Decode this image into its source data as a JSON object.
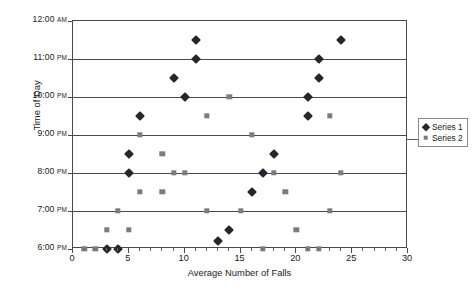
{
  "chart_data": {
    "type": "scatter",
    "title": "",
    "xlabel": "Average Number of Falls",
    "ylabel": "Time of Day",
    "xlim": [
      0,
      30
    ],
    "xticks": [
      0,
      5,
      10,
      15,
      20,
      25,
      30
    ],
    "xtick_labels": [
      "0",
      "5",
      "10",
      "15",
      "20",
      "25",
      "30"
    ],
    "yticks": [
      "6:00 PM",
      "7:00 PM",
      "8:00 PM",
      "9:00 PM",
      "10:00 PM",
      "11:00 PM",
      "12:00 AM"
    ],
    "ytick_labels": [
      {
        "time": "12:00",
        "meridiem": "AM",
        "hour_value": 24
      },
      {
        "time": "11:00",
        "meridiem": "PM",
        "hour_value": 23
      },
      {
        "time": "10:00",
        "meridiem": "PM",
        "hour_value": 22
      },
      {
        "time": "9:00",
        "meridiem": "PM",
        "hour_value": 21
      },
      {
        "time": "8:00",
        "meridiem": "PM",
        "hour_value": 20
      },
      {
        "time": "7:00",
        "meridiem": "PM",
        "hour_value": 19
      },
      {
        "time": "6:00",
        "meridiem": "PM",
        "hour_value": 18
      }
    ],
    "ylim": [
      18,
      24
    ],
    "grid": "horizontal",
    "legend_position": "right",
    "legend": [
      "Series 1",
      "Series 2"
    ],
    "series": [
      {
        "name": "Series 1",
        "marker": "diamond",
        "color": "#26262e",
        "points": [
          {
            "x": 3,
            "y": 18.0,
            "time": "6:00 PM"
          },
          {
            "x": 4,
            "y": 18.0,
            "time": "6:00 PM"
          },
          {
            "x": 13,
            "y": 18.2,
            "time": "6:12 PM"
          },
          {
            "x": 14,
            "y": 18.5,
            "time": "6:30 PM"
          },
          {
            "x": 16,
            "y": 19.5,
            "time": "7:30 PM"
          },
          {
            "x": 5,
            "y": 20.0,
            "time": "8:00 PM"
          },
          {
            "x": 17,
            "y": 20.0,
            "time": "8:00 PM"
          },
          {
            "x": 5,
            "y": 20.5,
            "time": "8:30 PM"
          },
          {
            "x": 18,
            "y": 20.5,
            "time": "8:30 PM"
          },
          {
            "x": 6,
            "y": 21.5,
            "time": "9:30 PM"
          },
          {
            "x": 21,
            "y": 21.5,
            "time": "9:30 PM"
          },
          {
            "x": 10,
            "y": 22.0,
            "time": "10:00 PM"
          },
          {
            "x": 21,
            "y": 22.0,
            "time": "10:00 PM"
          },
          {
            "x": 9,
            "y": 22.5,
            "time": "10:30 PM"
          },
          {
            "x": 22,
            "y": 22.5,
            "time": "10:30 PM"
          },
          {
            "x": 11,
            "y": 23.0,
            "time": "11:00 PM"
          },
          {
            "x": 22,
            "y": 23.0,
            "time": "11:00 PM"
          },
          {
            "x": 11,
            "y": 23.5,
            "time": "11:30 PM"
          },
          {
            "x": 24,
            "y": 23.5,
            "time": "11:30 PM"
          }
        ]
      },
      {
        "name": "Series 2",
        "marker": "square",
        "color": "#7b7b83",
        "points": [
          {
            "x": 1,
            "y": 18.0,
            "time": "6:00 PM"
          },
          {
            "x": 2,
            "y": 18.0,
            "time": "6:00 PM"
          },
          {
            "x": 17,
            "y": 18.0,
            "time": "6:00 PM"
          },
          {
            "x": 21,
            "y": 18.0,
            "time": "6:00 PM"
          },
          {
            "x": 22,
            "y": 18.0,
            "time": "6:00 PM"
          },
          {
            "x": 3,
            "y": 18.5,
            "time": "6:30 PM"
          },
          {
            "x": 5,
            "y": 18.5,
            "time": "6:30 PM"
          },
          {
            "x": 20,
            "y": 18.5,
            "time": "6:30 PM"
          },
          {
            "x": 4,
            "y": 19.0,
            "time": "7:00 PM"
          },
          {
            "x": 12,
            "y": 19.0,
            "time": "7:00 PM"
          },
          {
            "x": 15,
            "y": 19.0,
            "time": "7:00 PM"
          },
          {
            "x": 23,
            "y": 19.0,
            "time": "7:00 PM"
          },
          {
            "x": 6,
            "y": 19.5,
            "time": "7:30 PM"
          },
          {
            "x": 8,
            "y": 19.5,
            "time": "7:30 PM"
          },
          {
            "x": 19,
            "y": 19.5,
            "time": "7:30 PM"
          },
          {
            "x": 9,
            "y": 20.0,
            "time": "8:00 PM"
          },
          {
            "x": 10,
            "y": 20.0,
            "time": "8:00 PM"
          },
          {
            "x": 18,
            "y": 20.0,
            "time": "8:00 PM"
          },
          {
            "x": 24,
            "y": 20.0,
            "time": "8:00 PM"
          },
          {
            "x": 8,
            "y": 20.5,
            "time": "8:30 PM"
          },
          {
            "x": 6,
            "y": 21.0,
            "time": "9:00 PM"
          },
          {
            "x": 16,
            "y": 21.0,
            "time": "9:00 PM"
          },
          {
            "x": 12,
            "y": 21.5,
            "time": "9:30 PM"
          },
          {
            "x": 23,
            "y": 21.5,
            "time": "9:30 PM"
          },
          {
            "x": 14,
            "y": 22.0,
            "time": "10:00 PM"
          }
        ]
      }
    ]
  }
}
